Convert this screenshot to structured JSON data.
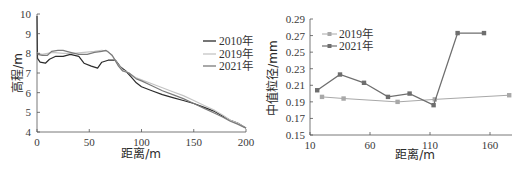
{
  "chart_data": [
    {
      "type": "line",
      "title": "",
      "xlabel": "距离/m",
      "ylabel": "高程/m",
      "xlim": [
        0,
        200
      ],
      "ylim": [
        4,
        10
      ],
      "xticks": [
        0,
        50,
        100,
        150,
        200
      ],
      "yticks": [
        4,
        5,
        6,
        7,
        8,
        9,
        10
      ],
      "grid": false,
      "legend_position": "upper right",
      "series": [
        {
          "name": "2010年",
          "color": "#2b2b2b",
          "x": [
            0,
            0.5,
            3,
            8,
            12,
            18,
            25,
            32,
            40,
            45,
            52,
            58,
            62,
            68,
            75,
            80,
            85,
            90,
            95,
            100,
            110,
            120,
            130,
            140,
            150,
            160,
            170,
            178,
            185,
            192,
            200
          ],
          "y": [
            9.9,
            7.75,
            7.55,
            7.5,
            7.7,
            7.85,
            7.85,
            7.95,
            7.85,
            7.5,
            7.35,
            7.25,
            7.55,
            7.65,
            7.65,
            7.3,
            7.1,
            6.8,
            6.5,
            6.3,
            6.1,
            5.9,
            5.75,
            5.6,
            5.45,
            5.25,
            5.05,
            4.8,
            4.6,
            4.45,
            4.2
          ]
        },
        {
          "name": "2019年",
          "color": "#c4c4c4",
          "x": [
            0,
            1,
            5,
            10,
            15,
            25,
            35,
            45,
            55,
            62,
            68,
            73,
            78,
            82,
            88,
            95,
            100,
            110,
            120,
            130,
            140,
            150,
            160,
            170,
            178,
            185,
            192,
            200
          ],
          "y": [
            8.05,
            8.0,
            7.95,
            8.0,
            8.05,
            8.0,
            8.0,
            8.05,
            8.1,
            8.15,
            8.1,
            7.8,
            7.4,
            7.15,
            7.0,
            6.75,
            6.65,
            6.45,
            6.25,
            6.05,
            5.85,
            5.6,
            5.35,
            5.1,
            4.85,
            4.6,
            4.45,
            4.2
          ]
        },
        {
          "name": "2021年",
          "color": "#7a7a7a",
          "x": [
            0,
            1,
            5,
            10,
            14,
            20,
            25,
            32,
            40,
            48,
            55,
            62,
            66,
            72,
            78,
            82,
            88,
            95,
            100,
            110,
            120,
            130,
            140,
            150,
            160,
            170,
            178,
            185,
            192,
            200
          ],
          "y": [
            8.0,
            7.95,
            7.9,
            7.9,
            8.1,
            8.15,
            8.15,
            8.05,
            7.95,
            7.95,
            8.05,
            8.1,
            8.15,
            7.9,
            7.35,
            7.1,
            7.0,
            6.7,
            6.6,
            6.35,
            6.1,
            5.9,
            5.7,
            5.45,
            5.2,
            4.95,
            4.75,
            4.55,
            4.4,
            4.2
          ]
        }
      ]
    },
    {
      "type": "line",
      "title": "",
      "xlabel": "距离/m",
      "ylabel": "中值粒径/mm",
      "xlim": [
        10,
        180
      ],
      "ylim": [
        0.15,
        0.29
      ],
      "xticks": [
        10,
        60,
        110,
        160
      ],
      "yticks": [
        0.15,
        0.17,
        0.19,
        0.21,
        0.23,
        0.25,
        0.27,
        0.29
      ],
      "grid": false,
      "legend_position": "upper left",
      "series": [
        {
          "name": "2019年",
          "color": "#a8a8a8",
          "marker": "square",
          "x": [
            20,
            38,
            83,
            114,
            176
          ],
          "y": [
            0.196,
            0.194,
            0.19,
            0.193,
            0.198
          ]
        },
        {
          "name": "2021年",
          "color": "#6e6e6e",
          "marker": "square",
          "x": [
            16,
            35,
            55,
            75,
            93,
            113,
            133,
            155
          ],
          "y": [
            0.204,
            0.223,
            0.213,
            0.196,
            0.2,
            0.186,
            0.273,
            0.273
          ]
        }
      ]
    }
  ],
  "left": {
    "ylabel": "高程/m",
    "xlabel": "距离/m",
    "yticks": [
      "4",
      "5",
      "6",
      "7",
      "8",
      "9",
      "10"
    ],
    "xticks": [
      "0",
      "50",
      "100",
      "150",
      "200"
    ],
    "legend": [
      "2010年",
      "2019年",
      "2021年"
    ]
  },
  "right": {
    "ylabel": "中值粒径/mm",
    "xlabel": "距离/m",
    "yticks": [
      "0.15",
      "0.17",
      "0.19",
      "0.21",
      "0.23",
      "0.25",
      "0.27",
      "0.29"
    ],
    "xticks": [
      "10",
      "60",
      "110",
      "160"
    ],
    "legend": [
      "2019年",
      "2021年"
    ]
  }
}
